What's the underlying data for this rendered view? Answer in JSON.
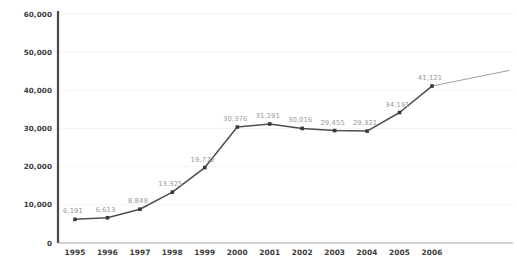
{
  "chart_data": {
    "type": "line",
    "title": "",
    "subtitle": "",
    "xlabel": "",
    "ylabel": "",
    "categories": [
      "1995",
      "1996",
      "1997",
      "1998",
      "1999",
      "2000",
      "2001",
      "2002",
      "2003",
      "2004",
      "2005",
      "2006"
    ],
    "values": [
      6191,
      6613,
      8849,
      13325,
      19772,
      30376,
      31191,
      30016,
      29455,
      29321,
      34191,
      41121
    ],
    "point_labels": [
      "6,191",
      "6,613",
      "8,849",
      "13,325",
      "19,772",
      "30,376",
      "31,191",
      "30,016",
      "29,455",
      "29,321",
      "34,191",
      "41,121"
    ],
    "ylim": [
      0,
      60000
    ],
    "ytick_values": [
      0,
      10000,
      20000,
      30000,
      40000,
      50000,
      60000
    ],
    "ytick_labels": [
      "0",
      "10,000",
      "20,000",
      "30,000",
      "40,000",
      "50,000",
      "60,000"
    ],
    "grid": true,
    "grid_axis": "y",
    "legend": false,
    "legend_position": "none",
    "series": [
      {
        "name": "",
        "values": [
          6191,
          6613,
          8849,
          13325,
          19772,
          30376,
          31191,
          30016,
          29455,
          29321,
          34191,
          41121
        ],
        "color": "#4d4d4d",
        "marker": "square",
        "show_labels": true
      }
    ],
    "annotations": [
      {
        "name": "forecast-squiggle",
        "type": "wavy-trend-line",
        "description": "Wavy hand-drawn style line continuing upward to the right from the 2006 data point",
        "start_value": 41121,
        "end_value": 45200,
        "color": "#8f8f8f"
      }
    ]
  },
  "colors": {
    "background": "#ffffff",
    "line": "#4d4d4d",
    "marker": "#3a3a3a",
    "point_label": "#9a9a9a",
    "tick_label": "#3c3c3c",
    "gridline": "#f2f2f2",
    "y_axis": "#4a4a4a",
    "x_axis": "#9a9a9a",
    "forecast": "#8f8f8f"
  }
}
